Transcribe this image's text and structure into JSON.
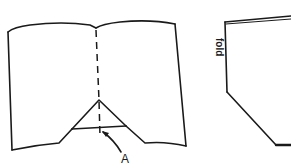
{
  "figure": {
    "left_panel": {
      "description": "open book with bottom corner folded into triangle",
      "label_a": "A"
    },
    "right_panel": {
      "description": "folded sheet with angled cut corner",
      "fold_label": "fold"
    }
  }
}
